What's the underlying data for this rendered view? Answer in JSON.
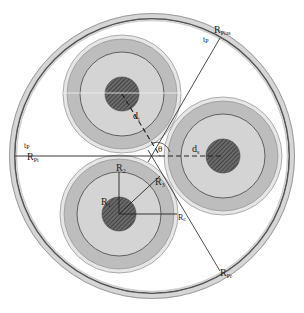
{
  "diagram": {
    "title": "",
    "colors": {
      "background": "#ffffff",
      "pipe_band": "#d8d8d8",
      "pipe_line": "#555555",
      "sheath": "#bdbdbd",
      "insulation": "#d3d3d3",
      "core": "#555555",
      "line": "#222222"
    },
    "labels": {
      "r_pias": {
        "main": "R",
        "sub": "Pias"
      },
      "t_p_top": {
        "main": "t",
        "sub": "P"
      },
      "t_p_left": {
        "main": "t",
        "sub": "P"
      },
      "r_pi_left": {
        "main": "R",
        "sub": "Pi"
      },
      "r_pr": {
        "main": "R",
        "sub": "Pr"
      },
      "d_i": {
        "main": "d",
        "sub": "i"
      },
      "d_s": {
        "main": "d",
        "sub": "s"
      },
      "theta": {
        "main": "θ",
        "sub": ""
      },
      "r_1": {
        "main": "R",
        "sub": "1"
      },
      "r_2": {
        "main": "R",
        "sub": "2"
      },
      "r_3": {
        "main": "R",
        "sub": "3"
      },
      "r_c": {
        "main": "R",
        "sub": "c"
      }
    },
    "cables": [
      {
        "name": "top-cable",
        "cx": 122,
        "cy": 94
      },
      {
        "name": "bottom-cable",
        "cx": 119,
        "cy": 214
      },
      {
        "name": "right-cable",
        "cx": 223,
        "cy": 156
      }
    ]
  }
}
